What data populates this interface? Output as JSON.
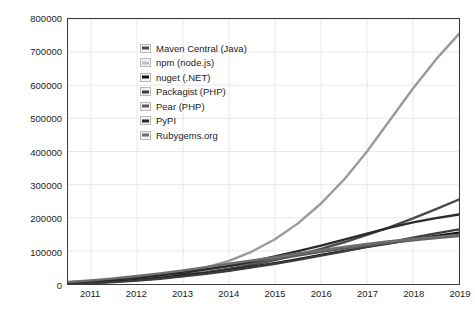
{
  "chart_data": {
    "type": "line",
    "title": "",
    "xlabel": "",
    "ylabel": "",
    "xlim": [
      2010.5,
      2019
    ],
    "ylim": [
      0,
      800000
    ],
    "grid": true,
    "legend_position": "top-left",
    "x_ticks": [
      "2011",
      "2012",
      "2013",
      "2014",
      "2015",
      "2016",
      "2017",
      "2018",
      "2019"
    ],
    "x_tick_values": [
      2011,
      2012,
      2013,
      2014,
      2015,
      2016,
      2017,
      2018,
      2019
    ],
    "y_ticks": [
      "0",
      "100000",
      "200000",
      "300000",
      "400000",
      "500000",
      "600000",
      "700000",
      "800000"
    ],
    "y_tick_values": [
      0,
      100000,
      200000,
      300000,
      400000,
      500000,
      600000,
      700000,
      800000
    ],
    "x": [
      2010.5,
      2011,
      2011.5,
      2012,
      2012.5,
      2013,
      2013.5,
      2014,
      2014.5,
      2015,
      2015.5,
      2016,
      2016.5,
      2017,
      2017.5,
      2018,
      2018.5,
      2019
    ],
    "series": [
      {
        "name": "Maven Central (Java)",
        "color": "#4a4a4a",
        "values": [
          3000,
          6000,
          10000,
          15000,
          21000,
          28000,
          36000,
          46000,
          58000,
          72000,
          88000,
          106000,
          126000,
          148000,
          172000,
          198000,
          226000,
          255000
        ]
      },
      {
        "name": "npm (node.js)",
        "color": "#9a9a9a",
        "values": [
          2000,
          4000,
          8000,
          14000,
          23000,
          35000,
          50000,
          70000,
          98000,
          135000,
          183000,
          243000,
          315000,
          400000,
          495000,
          590000,
          678000,
          755000
        ]
      },
      {
        "name": "nuget (.NET)",
        "color": "#141414",
        "values": [
          1500,
          3500,
          7000,
          12000,
          18000,
          25000,
          33000,
          42000,
          52000,
          63000,
          75000,
          88000,
          100000,
          112000,
          123000,
          135000,
          145000,
          155000
        ]
      },
      {
        "name": "Packagist (PHP)",
        "color": "#3c3c3c",
        "values": [
          1000,
          2500,
          5500,
          10000,
          16000,
          23000,
          31000,
          40000,
          50000,
          61000,
          73000,
          86000,
          99000,
          112000,
          126000,
          140000,
          153000,
          165000
        ]
      },
      {
        "name": "Pear (PHP)",
        "color": "#5c5c5c",
        "values": [
          5000,
          9000,
          14000,
          20000,
          27000,
          35000,
          44000,
          54000,
          64000,
          75000,
          86000,
          97000,
          107000,
          116000,
          124000,
          132000,
          139000,
          145000
        ]
      },
      {
        "name": "PyPI",
        "color": "#2a2a2a",
        "values": [
          4000,
          8000,
          13000,
          19000,
          26000,
          34000,
          44000,
          55000,
          68000,
          83000,
          99000,
          116000,
          134000,
          152000,
          170000,
          186000,
          199000,
          210000
        ]
      },
      {
        "name": "Rubygems.org",
        "color": "#6e6e6e",
        "values": [
          6000,
          11000,
          17000,
          24000,
          32000,
          41000,
          51000,
          61000,
          71000,
          81000,
          92000,
          102000,
          112000,
          121000,
          129000,
          136000,
          142000,
          148000
        ]
      }
    ]
  },
  "legend": {
    "items": [
      {
        "label": "Maven Central (Java)",
        "color": "#4a4a4a"
      },
      {
        "label": "npm (node.js)",
        "color": "#bdbdbd"
      },
      {
        "label": "nuget (.NET)",
        "color": "#141414"
      },
      {
        "label": "Packagist (PHP)",
        "color": "#3c3c3c"
      },
      {
        "label": "Pear (PHP)",
        "color": "#5c5c5c"
      },
      {
        "label": "PyPI",
        "color": "#2a2a2a"
      },
      {
        "label": "Rubygems.org",
        "color": "#6e6e6e"
      }
    ]
  },
  "style": {
    "grid_color": "#e8e8e8",
    "axis_color": "#3a3a3a",
    "background": "#ffffff",
    "text_color": "#1c1c1c"
  }
}
